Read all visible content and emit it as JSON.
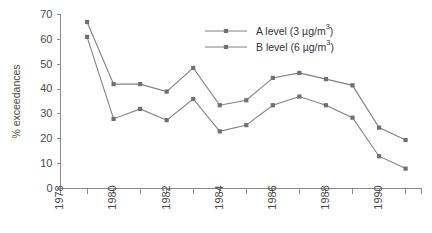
{
  "chart_data": {
    "type": "line",
    "title": "",
    "subtitle": "",
    "xlabel": "",
    "ylabel": "% exceedances",
    "x": [
      1979,
      1980,
      1981,
      1982,
      1983,
      1984,
      1985,
      1986,
      1987,
      1988,
      1989,
      1990,
      1991
    ],
    "xlim": [
      1978,
      1991.6
    ],
    "ylim": [
      0,
      70
    ],
    "yticks": [
      0,
      10,
      20,
      30,
      40,
      50,
      60,
      70
    ],
    "ytick_labels": [
      "0",
      "10",
      "20",
      "30",
      "40",
      "50",
      "60",
      "70"
    ],
    "xticks": [
      1978,
      1979,
      1980,
      1981,
      1982,
      1983,
      1984,
      1985,
      1986,
      1987,
      1988,
      1989,
      1990,
      1991
    ],
    "xtick_labels_shown": [
      "1978",
      "1980",
      "1982",
      "1984",
      "1986",
      "1988",
      "1990"
    ],
    "xtick_label_values": [
      1978,
      1980,
      1982,
      1984,
      1986,
      1988,
      1990
    ],
    "grid": false,
    "legend_position": "top-right",
    "series": [
      {
        "name": "A  level (3 µg/m",
        "name_sup": "3",
        "name_tail": ")",
        "label_plain": "A  level (3 µg/m3)",
        "color": "#808080",
        "marker": "square",
        "values": [
          67,
          42,
          42,
          39,
          48.5,
          33.5,
          35.5,
          44.5,
          46.5,
          44,
          41.5,
          24.5,
          19.5
        ]
      },
      {
        "name": "B  level (6 µg/m",
        "name_sup": "3",
        "name_tail": ")",
        "label_plain": "B  level (6 µg/m3)",
        "color": "#808080",
        "marker": "square",
        "values": [
          61,
          28,
          32,
          27.5,
          36,
          23,
          25.5,
          33.5,
          37,
          33.5,
          28.5,
          13,
          8
        ]
      }
    ]
  },
  "axis": {
    "y_title": "% exceedances"
  }
}
